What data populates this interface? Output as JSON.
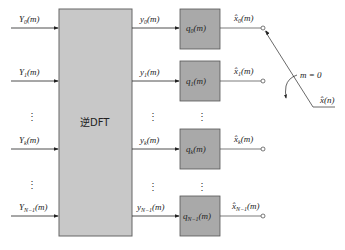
{
  "diagram": {
    "main_block": {
      "label": "逆DFT",
      "fill": "#c8c8c8",
      "stroke": "#666666"
    },
    "q_fill": "#a9a9a9",
    "inputs": [
      {
        "name": "Y",
        "sub": "0",
        "suffix": "(m)"
      },
      {
        "name": "Y",
        "sub": "1",
        "suffix": "(m)"
      },
      {
        "name": "Y",
        "sub": "k",
        "suffix": "(m)"
      },
      {
        "name": "Y",
        "sub": "N−1",
        "suffix": "(m)"
      }
    ],
    "mid_signals": [
      {
        "name": "y",
        "sub": "0",
        "suffix": "(m)"
      },
      {
        "name": "y",
        "sub": "1",
        "suffix": "(m)"
      },
      {
        "name": "y",
        "sub": "k",
        "suffix": "(m)"
      },
      {
        "name": "y",
        "sub": "N−1",
        "suffix": "(m)"
      }
    ],
    "filters": [
      {
        "name": "q",
        "sub": "0",
        "suffix": "(m)"
      },
      {
        "name": "q",
        "sub": "1",
        "suffix": "(m)"
      },
      {
        "name": "q",
        "sub": "k",
        "suffix": "(m)"
      },
      {
        "name": "q",
        "sub": "N−1",
        "suffix": "(m)"
      }
    ],
    "outputs": [
      {
        "name": "x̂",
        "sub": "0",
        "suffix": "(m)"
      },
      {
        "name": "x̂",
        "sub": "1",
        "suffix": "(m)"
      },
      {
        "name": "x̂",
        "sub": "k",
        "suffix": "(m)"
      },
      {
        "name": "x̂",
        "sub": "N−1",
        "suffix": "(m)"
      }
    ],
    "ellipsis": "⋮",
    "switch_label": "m = 0",
    "final_output": "x̂(n)"
  }
}
